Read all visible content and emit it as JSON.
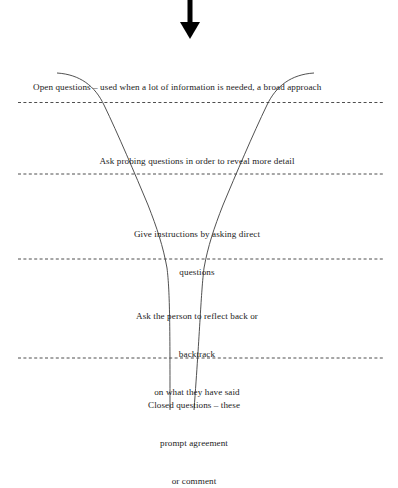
{
  "diagram": {
    "type": "funnel-questioning-diagram",
    "background_color": "#ffffff",
    "line_color": "#333333",
    "text_color": "#1b1b1b",
    "arrow": {
      "icon": "down-arrow-icon",
      "direction": "down",
      "color": "#000000"
    },
    "bands": [
      {
        "id": "open-questions",
        "lines": [
          "Open questions – used when a lot of information is needed, a broad approach"
        ],
        "align": "left"
      },
      {
        "id": "probing-questions",
        "lines": [
          "Ask probing questions in order to reveal more detail"
        ],
        "align": "center"
      },
      {
        "id": "direct-questions",
        "lines": [
          "Give instructions by asking direct",
          "questions"
        ],
        "align": "center"
      },
      {
        "id": "reflect-back",
        "lines": [
          "Ask the person to reflect back or",
          "backtrack",
          "on what they have said"
        ],
        "align": "center"
      },
      {
        "id": "closed-questions",
        "lines": [
          "Closed questions – these",
          "prompt agreement",
          "or comment"
        ],
        "align": "center"
      }
    ]
  }
}
